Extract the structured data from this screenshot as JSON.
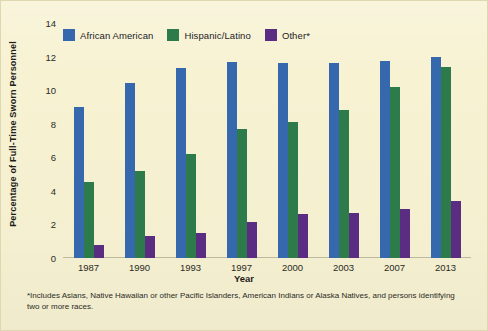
{
  "figure": {
    "background_color": "#f7f2d2",
    "footnote": "*Includes Asians, Native Hawaiian or other Pacific Islanders, American Indians or Alaska Natives, and persons identifying two or more races."
  },
  "chart_data": {
    "type": "bar",
    "title": "",
    "xlabel": "Year",
    "ylabel": "Percentage of Full-Time Sworn Personnel",
    "categories": [
      "1987",
      "1990",
      "1993",
      "1997",
      "2000",
      "2003",
      "2007",
      "2013"
    ],
    "series": [
      {
        "name": "African American",
        "color": "#3668ae",
        "values": [
          9.0,
          10.4,
          11.3,
          11.7,
          11.6,
          11.6,
          11.75,
          12.0
        ]
      },
      {
        "name": "Hispanic/Latino",
        "color": "#2d7a4b",
        "values": [
          4.5,
          5.2,
          6.2,
          7.7,
          8.1,
          8.8,
          10.2,
          11.4
        ]
      },
      {
        "name": "Other*",
        "color": "#5b2d82",
        "values": [
          0.8,
          1.3,
          1.5,
          2.15,
          2.6,
          2.7,
          2.9,
          3.4
        ]
      }
    ],
    "ylim": [
      0,
      14
    ],
    "yticks": [
      0,
      2,
      4,
      6,
      8,
      10,
      12,
      14
    ],
    "ytick_labels": [
      "0",
      "2",
      "4",
      "6",
      "8",
      "10",
      "12",
      "14"
    ],
    "grid": false,
    "legend_position": "top-left"
  }
}
